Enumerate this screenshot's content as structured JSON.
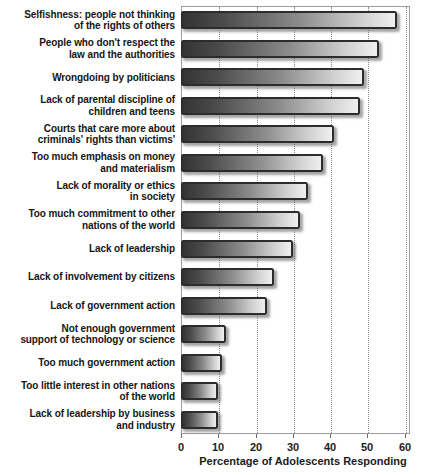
{
  "chart_data": {
    "type": "bar",
    "orientation": "horizontal",
    "title": "",
    "xlabel": "Percentage of Adolescents Responding",
    "ylabel": "",
    "xlim": [
      0,
      60
    ],
    "xticks": [
      0,
      10,
      20,
      30,
      40,
      50,
      60
    ],
    "grid": "vertical dotted gridlines, boxed plot frame",
    "legend": "none",
    "bar_style": {
      "fill": "horizontal gradient dark-to-light",
      "gradient_left_color": "#343434",
      "gradient_right_color": "#efefef",
      "border_color": "#2c2c2c",
      "shadow": "soft gray drop shadow"
    },
    "categories": [
      "Selfishness: people not thinking of the rights of others",
      "People who don't respect the law and the authorities",
      "Wrongdoing by politicians",
      "Lack of parental discipline of children and teens",
      "Courts that care more about criminals' rights than victims'",
      "Too much emphasis on money and materialism",
      "Lack of morality or ethics in society",
      "Too much commitment to other nations of the world",
      "Lack of leadership",
      "Lack of involvement by citizens",
      "Lack of government action",
      "Not enough government support of technology or science",
      "Too much government action",
      "Too little interest in other nations of the world",
      "Lack of leadership by business and industry"
    ],
    "categories_wrapped": [
      [
        "Selfishness: people not thinking",
        "of the rights of others"
      ],
      [
        "People who don't respect the",
        "law and the authorities"
      ],
      [
        "Wrongdoing by politicians"
      ],
      [
        "Lack of parental discipline of",
        "children and teens"
      ],
      [
        "Courts that care more about",
        "criminals' rights than victims'"
      ],
      [
        "Too much emphasis on money",
        "and materialism"
      ],
      [
        "Lack of morality or ethics",
        "in society"
      ],
      [
        "Too much commitment to other",
        "nations of the world"
      ],
      [
        "Lack of leadership"
      ],
      [
        "Lack of involvement by citizens"
      ],
      [
        "Lack of government action"
      ],
      [
        "Not enough government",
        "support of technology or science"
      ],
      [
        "Too much government action"
      ],
      [
        "Too little interest in other nations",
        "of the world"
      ],
      [
        "Lack of leadership by business",
        "and industry"
      ]
    ],
    "values": [
      58,
      53,
      49,
      48,
      41,
      38,
      34,
      32,
      30,
      25,
      23,
      12,
      11,
      10,
      10
    ]
  }
}
